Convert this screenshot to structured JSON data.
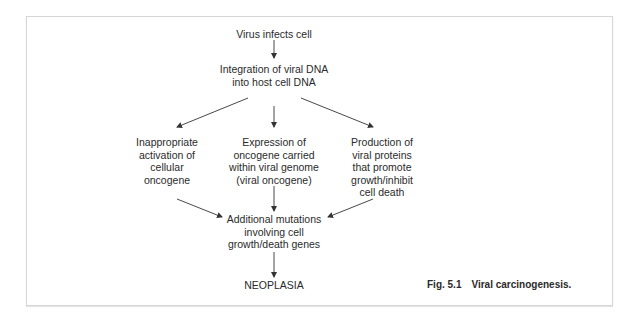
{
  "figure": {
    "caption_number": "Fig. 5.1",
    "caption_title": "Viral carcinogenesis.",
    "nodes": {
      "virus": [
        "Virus infects cell"
      ],
      "integration": [
        "Integration of viral DNA",
        "into host cell DNA"
      ],
      "cellular": [
        "Inappropriate",
        "activation of",
        "cellular",
        "oncogene"
      ],
      "viral_oncogene": [
        "Expression of",
        "oncogene carried",
        "within viral genome",
        "(viral oncogene)"
      ],
      "viral_proteins": [
        "Production of",
        "viral proteins",
        "that promote",
        "growth/inhibit",
        "cell death"
      ],
      "mutations": [
        "Additional mutations",
        "involving cell",
        "growth/death genes"
      ],
      "neoplasia": [
        "NEOPLASIA"
      ]
    },
    "edges": [
      [
        "virus",
        "integration"
      ],
      [
        "integration",
        "cellular"
      ],
      [
        "integration",
        "viral_oncogene"
      ],
      [
        "integration",
        "viral_proteins"
      ],
      [
        "cellular",
        "mutations"
      ],
      [
        "viral_oncogene",
        "mutations"
      ],
      [
        "viral_proteins",
        "mutations"
      ],
      [
        "mutations",
        "neoplasia"
      ]
    ],
    "colors": {
      "text": "#2a2a2a",
      "border": "#d6d6d6",
      "arrow": "#333333"
    }
  }
}
